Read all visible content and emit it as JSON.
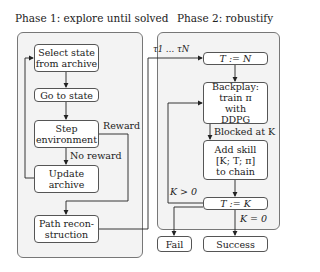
{
  "phase1": {
    "title": "Phase 1: explore until solved",
    "boxes": {
      "select": "Select state from archive",
      "goto": "Go to state",
      "step": "Step environment",
      "update": "Update archive",
      "path": "Path recon- struction"
    },
    "labels": {
      "reward": "Reward",
      "no_reward": "No reward"
    }
  },
  "phase2": {
    "title": "Phase 2: robustify",
    "boxes": {
      "t_n": "T := N",
      "backplay": "Backplay: train π with DDPG",
      "add_skill": "Add skill [K; T; π] to chain",
      "t_k": "T := K",
      "fail": "Fail",
      "success": "Success"
    },
    "labels": {
      "trajectories": "τ1 … τN",
      "blocked": "Blocked at K",
      "k_pos": "K > 0",
      "k_zero": "K = 0"
    }
  }
}
